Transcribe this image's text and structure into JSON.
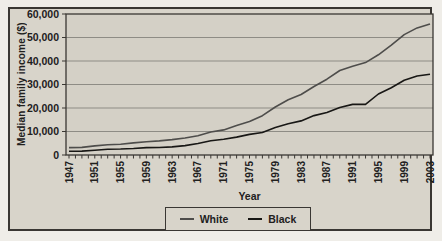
{
  "chart_data": {
    "type": "line",
    "title": "",
    "xlabel": "Year",
    "ylabel": "Median family income ($)",
    "xlim": [
      1947,
      2003
    ],
    "ylim": [
      0,
      60000
    ],
    "grid": "horizontal",
    "legend_position": "bottom-center",
    "x": [
      1947,
      1949,
      1951,
      1953,
      1955,
      1957,
      1959,
      1961,
      1963,
      1965,
      1967,
      1969,
      1971,
      1973,
      1975,
      1977,
      1979,
      1981,
      1983,
      1985,
      1987,
      1989,
      1991,
      1993,
      1995,
      1997,
      1999,
      2001,
      2003
    ],
    "series": [
      {
        "name": "White",
        "color": "#4e4d4b",
        "values": [
          3157,
          3232,
          3859,
          4392,
          4605,
          5166,
          5643,
          5981,
          6548,
          7251,
          8234,
          9794,
          10672,
          12595,
          14268,
          16740,
          20439,
          23517,
          25757,
          29152,
          32274,
          35975,
          37783,
          39300,
          42646,
          46754,
          51224,
          54067,
          55768
        ]
      },
      {
        "name": "Black",
        "color": "#181715",
        "values": [
          1614,
          1650,
          2032,
          2461,
          2549,
          2764,
          3161,
          3191,
          3465,
          3994,
          4875,
          6063,
          6714,
          7596,
          8779,
          9563,
          11644,
          13266,
          14506,
          16786,
          18098,
          20209,
          21548,
          21542,
          25970,
          28602,
          31778,
          33598,
          34369
        ]
      }
    ],
    "x_tick_years": [
      1947,
      1951,
      1955,
      1959,
      1963,
      1967,
      1971,
      1975,
      1979,
      1983,
      1987,
      1991,
      1995,
      1999,
      2003
    ],
    "y_ticks": [
      0,
      10000,
      20000,
      30000,
      40000,
      50000,
      60000
    ],
    "minor_x_ticks_every": 1
  },
  "colors": {
    "page_background": "#efede8",
    "panel_background": "#d8d4ca",
    "plot_background": "#d4d0c6",
    "border": "#3a3733",
    "gridline": "#8e8c85",
    "text": "#21201d"
  }
}
